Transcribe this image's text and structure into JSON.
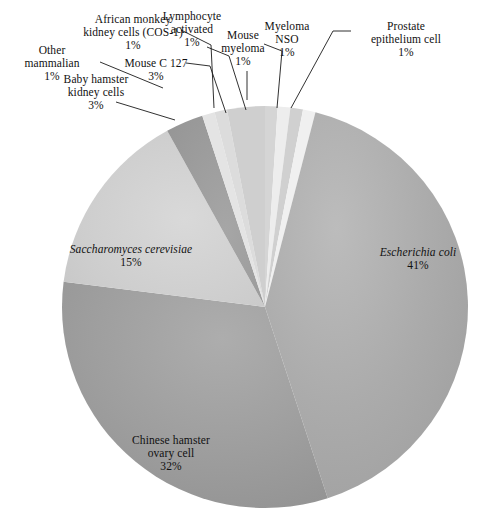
{
  "chart_data": {
    "type": "pie",
    "title": "",
    "xlabel": "",
    "ylabel": "",
    "legend_position": "none",
    "grid": false,
    "units": "percent",
    "start_angle_deg": 0,
    "direction": "clockwise",
    "categories": [
      "Prostate epithelium cell",
      "Myeloma NSO",
      "Mouse myeloma",
      "Lymphocyte activated",
      "Escherichia coli",
      "Chinese hamster ovary cell",
      "Saccharomyces cerevisiae",
      "Baby hamster kidney cells",
      "Other mammalian",
      "African monkey kidney cells (COS-1)",
      "Mouse C 127"
    ],
    "values": [
      1,
      1,
      1,
      1,
      41,
      32,
      15,
      3,
      1,
      1,
      3
    ],
    "slices": [
      {
        "label": "Prostate epithelium cell",
        "value": 1,
        "percent": "1%",
        "color": "#d5d5d5",
        "italic": false
      },
      {
        "label": "Myeloma NSO",
        "value": 1,
        "percent": "1%",
        "color": "#ededed",
        "italic": false
      },
      {
        "label": "Mouse myeloma",
        "value": 1,
        "percent": "1%",
        "color": "#d0d0d0",
        "italic": false
      },
      {
        "label": "Lymphocyte activated",
        "value": 1,
        "percent": "1%",
        "color": "#f0f0f0",
        "italic": false
      },
      {
        "label": "Escherichia coli",
        "value": 41,
        "percent": "41%",
        "color": "#a9a9a9",
        "italic": true
      },
      {
        "label": "Chinese hamster ovary cell",
        "value": 32,
        "percent": "32%",
        "color": "#9d9d9d",
        "italic": false
      },
      {
        "label": "Saccharomyces cerevisiae",
        "value": 15,
        "percent": "15%",
        "color": "#cccccc",
        "italic": true
      },
      {
        "label": "Baby hamster kidney cells",
        "value": 3,
        "percent": "3%",
        "color": "#9a9a9a",
        "italic": false
      },
      {
        "label": "Other mammalian",
        "value": 1,
        "percent": "1%",
        "color": "#e4e4e4",
        "italic": false
      },
      {
        "label": "African monkey kidney cells (COS-1)",
        "value": 1,
        "percent": "1%",
        "color": "#dcdcdc",
        "italic": false
      },
      {
        "label": "Mouse C 127",
        "value": 3,
        "percent": "3%",
        "color": "#cfcfcf",
        "italic": false
      }
    ]
  },
  "labels": {
    "other_mammalian": {
      "name": "Other\nmammalian",
      "line1": "Other",
      "line2": "mammalian",
      "percent": "1%"
    },
    "baby_hamster": {
      "line1": "Baby hamster",
      "line2": "kidney cells",
      "percent": "3%"
    },
    "cos1": {
      "line1": "African monkey",
      "line2": "kidney cells (COS-1)",
      "percent": "1%"
    },
    "mouse_c127": {
      "line1": "Mouse C 127",
      "line2": "",
      "percent": "3%"
    },
    "lymphocyte": {
      "line1": "Lymphocyte",
      "line2": "activated",
      "percent": "1%"
    },
    "mouse_myeloma": {
      "line1": "Mouse",
      "line2": "myeloma",
      "percent": "1%"
    },
    "myeloma_nso": {
      "line1": "Myeloma",
      "line2": "NSO",
      "percent": "1%"
    },
    "prostate": {
      "line1": "Prostate",
      "line2": "epithelium cell",
      "percent": "1%"
    },
    "ecoli": {
      "line1": "Escherichia coli",
      "line2": "",
      "percent": "41%"
    },
    "saccharomyces": {
      "line1": "Saccharomyces cerevisiae",
      "line2": "",
      "percent": "15%"
    },
    "cho": {
      "line1": "Chinese hamster",
      "line2": "ovary cell",
      "percent": "32%"
    }
  },
  "style": {
    "background": "#ffffff",
    "text_color": "#111111",
    "leader_line_color": "#1a1a1a"
  }
}
